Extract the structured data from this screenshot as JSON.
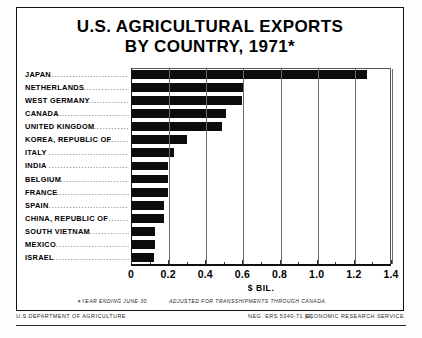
{
  "title": {
    "line1": "U.S. AGRICULTURAL EXPORTS",
    "line2": "BY COUNTRY, 1971*"
  },
  "footnotes": {
    "star_symbol": "✶",
    "note1": "YEAR ENDING JUNE 30.",
    "note2": "ADJUSTED FOR TRANSSHIPMENTS THROUGH CANADA."
  },
  "credits": {
    "agency": "U.S.DEPARTMENT OF AGRICULTURE",
    "neg": "NEG. ERS 5340-71 (9)",
    "service": "ECONOMIC RESEARCH SERVICE"
  },
  "chart_data": {
    "type": "bar",
    "orientation": "horizontal",
    "title": "U.S. AGRICULTURAL EXPORTS BY COUNTRY, 1971*",
    "xlabel": "$ BIL.",
    "ylabel": "",
    "xlim": [
      0,
      1.4
    ],
    "xticks": [
      "0",
      "0.2",
      "0.4",
      "0.6",
      "0.8",
      "1.0",
      "1.2",
      "1.4"
    ],
    "xtick_values": [
      0,
      0.2,
      0.4,
      0.6,
      0.8,
      1.0,
      1.2,
      1.4
    ],
    "grid": true,
    "legend": "none",
    "bar_color": "#0c0c0c",
    "categories": [
      "JAPAN",
      "NETHERLANDS",
      "WEST GERMANY",
      "CANADA",
      "UNITED KINGDOM",
      "KOREA, REPUBLIC OF",
      "ITALY",
      "INDIA",
      "BELGIUM",
      "FRANCE",
      "SPAIN",
      "CHINA, REPUBLIC OF",
      "SOUTH VIETNAM",
      "MEXICO",
      "ISRAEL"
    ],
    "values": [
      1.27,
      0.61,
      0.6,
      0.51,
      0.49,
      0.3,
      0.23,
      0.2,
      0.2,
      0.2,
      0.175,
      0.175,
      0.13,
      0.13,
      0.125
    ]
  }
}
